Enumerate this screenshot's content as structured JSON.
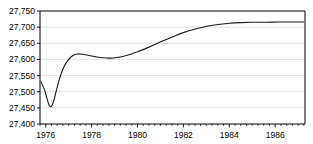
{
  "chart_data": {
    "type": "line",
    "title": "",
    "subtitle": "",
    "xlabel": "",
    "ylabel": "",
    "xlim": [
      1975.75,
      1987.3
    ],
    "ylim": [
      27400,
      27750
    ],
    "ytick_labels": [
      "27,750",
      "27,700",
      "27,650",
      "27,600",
      "27,550",
      "27,500",
      "27,450",
      "27,400"
    ],
    "ytick_values": [
      27750,
      27700,
      27650,
      27600,
      27550,
      27500,
      27450,
      27400
    ],
    "xtick_labels": [
      "1976",
      "1978",
      "1980",
      "1982",
      "1984",
      "1986"
    ],
    "xtick_values": [
      1976,
      1978,
      1980,
      1982,
      1984,
      1986
    ],
    "x_minor_step": 0.25,
    "grid": "horizontal",
    "legend": "none",
    "line_color": "#1a1a1a",
    "grid_color": "#d9d9d9",
    "axis_color": "#000000",
    "series": [
      {
        "name": "series-1",
        "x": [
          1975.8,
          1975.95,
          1976.05,
          1976.15,
          1976.25,
          1976.35,
          1976.45,
          1976.6,
          1976.8,
          1977.0,
          1977.2,
          1977.4,
          1977.6,
          1977.9,
          1978.2,
          1978.5,
          1978.8,
          1979.1,
          1979.4,
          1979.7,
          1980.0,
          1980.4,
          1980.8,
          1981.2,
          1981.6,
          1982.0,
          1982.4,
          1982.8,
          1983.2,
          1983.6,
          1984.0,
          1984.5,
          1985.0,
          1985.6,
          1986.2,
          1986.8,
          1987.25
        ],
        "y": [
          27530,
          27505,
          27480,
          27458,
          27455,
          27472,
          27500,
          27540,
          27578,
          27600,
          27613,
          27617,
          27616,
          27612,
          27608,
          27605,
          27604,
          27606,
          27610,
          27616,
          27624,
          27635,
          27648,
          27660,
          27672,
          27683,
          27692,
          27699,
          27705,
          27709,
          27712,
          27714,
          27715,
          27715,
          27716,
          27716,
          27716
        ]
      }
    ]
  },
  "figure": {
    "plot_left": 40,
    "plot_right": 305,
    "plot_top": 11,
    "plot_bottom": 124
  }
}
